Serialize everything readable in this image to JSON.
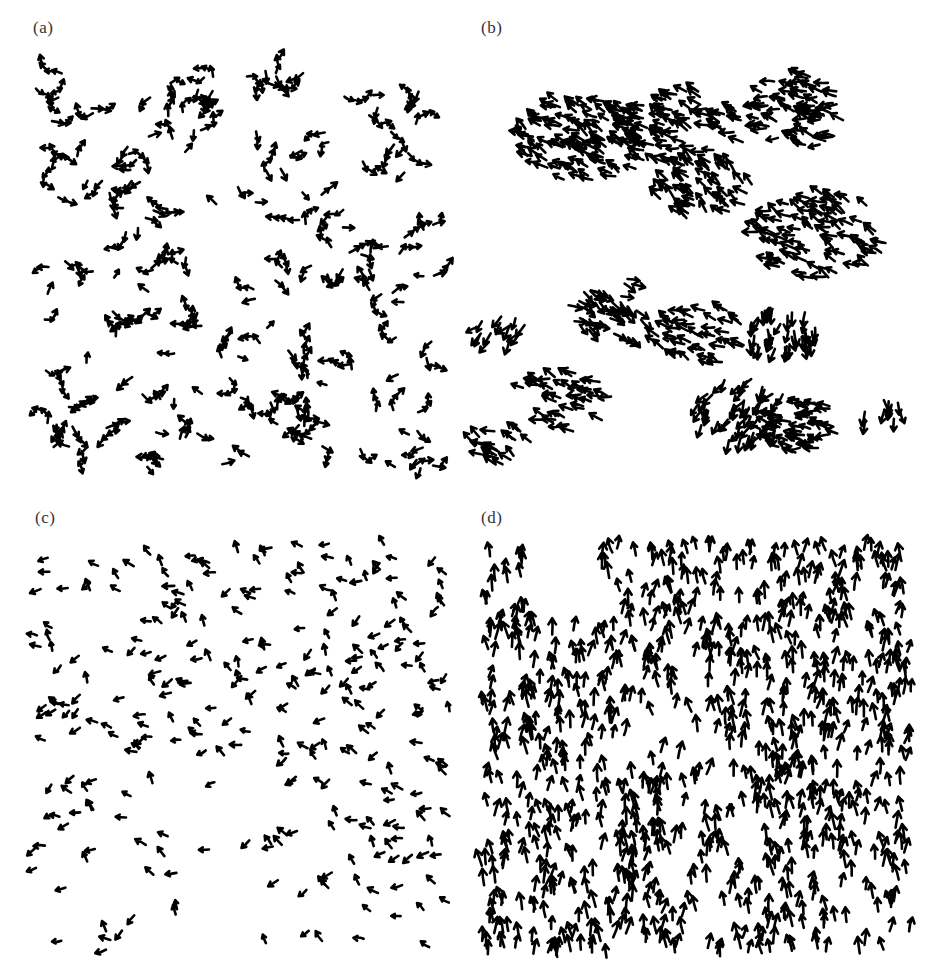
{
  "figure": {
    "panels": [
      {
        "id": "a",
        "label": "(a)",
        "label_pos": [
          33,
          32
        ],
        "field": {
          "x": 30,
          "y": 65,
          "w": 410,
          "h": 410
        },
        "description": "disordered phase: randomly oriented chains of arrow-shaped particles",
        "glyph_count": 520,
        "mode": "random",
        "seed": 11,
        "heading_deg": null,
        "clusters": []
      },
      {
        "id": "b",
        "label": "(b)",
        "label_pos": [
          15,
          32
        ],
        "field": {
          "x": 10,
          "y": 60,
          "w": 420,
          "h": 410
        },
        "description": "clustered phase: dense flocks of arrows with local alignment",
        "glyph_count": 700,
        "mode": "clusters",
        "seed": 23,
        "heading_deg": null,
        "clusters": [
          {
            "cx": 110,
            "cy": 80,
            "r": 55,
            "n": 110,
            "heading": 210
          },
          {
            "cx": 210,
            "cy": 70,
            "r": 50,
            "n": 80,
            "heading": 200
          },
          {
            "cx": 330,
            "cy": 50,
            "r": 45,
            "n": 70,
            "heading": 190
          },
          {
            "cx": 230,
            "cy": 130,
            "r": 40,
            "n": 60,
            "heading": 215
          },
          {
            "cx": 345,
            "cy": 175,
            "r": 55,
            "n": 90,
            "heading": 205
          },
          {
            "cx": 140,
            "cy": 250,
            "r": 40,
            "n": 45,
            "heading": 30
          },
          {
            "cx": 225,
            "cy": 275,
            "r": 40,
            "n": 45,
            "heading": 200
          },
          {
            "cx": 305,
            "cy": 270,
            "r": 30,
            "n": 40,
            "heading": 100
          },
          {
            "cx": 90,
            "cy": 340,
            "r": 40,
            "n": 40,
            "heading": 195
          },
          {
            "cx": 265,
            "cy": 350,
            "r": 40,
            "n": 50,
            "heading": 120
          },
          {
            "cx": 325,
            "cy": 365,
            "r": 35,
            "n": 50,
            "heading": 190
          },
          {
            "cx": 25,
            "cy": 385,
            "r": 25,
            "n": 20,
            "heading": 210
          },
          {
            "cx": 25,
            "cy": 270,
            "r": 22,
            "n": 15,
            "heading": 130
          },
          {
            "cx": 405,
            "cy": 350,
            "r": 18,
            "n": 10,
            "heading": 90
          }
        ]
      },
      {
        "id": "c",
        "label": "(c)",
        "label_pos": [
          35,
          32
        ],
        "field": {
          "x": 32,
          "y": 50,
          "w": 420,
          "h": 410
        },
        "description": "intermediate phase: small clusters of arrows pointing mostly to the left",
        "glyph_count": 330,
        "mode": "drift",
        "seed": 37,
        "heading_deg": 190,
        "heading_spread": 70,
        "clusters": []
      },
      {
        "id": "d",
        "label": "(d)",
        "label_pos": [
          15,
          32
        ],
        "field": {
          "x": 15,
          "y": 50,
          "w": 430,
          "h": 410
        },
        "description": "ordered phase: arrows aligned and pointing upward",
        "glyph_count": 900,
        "mode": "aligned",
        "seed": 53,
        "heading_deg": 270,
        "heading_spread": 22,
        "clusters": []
      }
    ],
    "style": {
      "glyph_color": "#000000",
      "background": "#ffffff",
      "label_color": "#333333"
    }
  }
}
